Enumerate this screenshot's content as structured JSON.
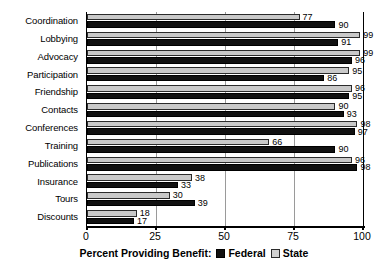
{
  "chart_data": {
    "type": "bar",
    "orientation": "horizontal",
    "title": "",
    "xlabel": "Percent Providing Benefit:",
    "ylabel": "",
    "xlim": [
      0,
      100
    ],
    "xticks": [
      0,
      25,
      50,
      75,
      100
    ],
    "xticklabels": [
      "0",
      "25",
      "50",
      "75",
      "100"
    ],
    "grid": true,
    "grid_axis": "x",
    "legend_position": "bottom-center-inline",
    "categories": [
      "Coordination",
      "Lobbying",
      "Advocacy",
      "Participation",
      "Friendship",
      "Contacts",
      "Conferences",
      "Training",
      "Publications",
      "Insurance",
      "Tours",
      "Discounts"
    ],
    "series": [
      {
        "name": "State",
        "color": "#c9c9c9",
        "values": [
          77,
          99,
          99,
          95,
          96,
          90,
          98,
          66,
          96,
          38,
          30,
          18
        ]
      },
      {
        "name": "Federal",
        "color": "#111111",
        "values": [
          90,
          91,
          96,
          86,
          95,
          93,
          97,
          90,
          98,
          33,
          39,
          17
        ]
      }
    ],
    "series_draw_order": [
      "State",
      "Federal"
    ],
    "data_labels": true
  },
  "legend": {
    "axis_title": "Percent Providing Benefit:",
    "entries": [
      {
        "label": "Federal",
        "swatch": "federal"
      },
      {
        "label": "State",
        "swatch": "state"
      }
    ]
  }
}
